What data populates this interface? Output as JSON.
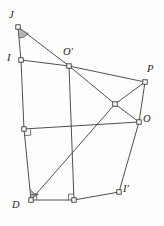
{
  "figure": {
    "type": "geometry-diagram",
    "width": 164,
    "height": 226,
    "background_color": "#fdfdfc",
    "stroke_color": "#3c3c3c",
    "vertex_fill_color": "#ffffff",
    "label_color": "#1d1d1d",
    "points": [
      {
        "id": "J",
        "label": "J",
        "x": 18,
        "y": 27,
        "label_x": 9,
        "label_y": 10,
        "marked": true
      },
      {
        "id": "I",
        "label": "I",
        "x": 21,
        "y": 60,
        "label_x": 7,
        "label_y": 53,
        "marked": true
      },
      {
        "id": "Op",
        "label": "O'",
        "x": 69,
        "y": 66,
        "label_x": 63,
        "label_y": 47,
        "marked": true
      },
      {
        "id": "P",
        "label": "P",
        "x": 145,
        "y": 82,
        "label_x": 147,
        "label_y": 64,
        "marked": true
      },
      {
        "id": "O",
        "label": "O",
        "x": 139,
        "y": 122,
        "label_x": 143,
        "label_y": 114,
        "marked": true
      },
      {
        "id": "Ip",
        "label": "I'",
        "x": 119,
        "y": 192,
        "label_x": 123,
        "label_y": 184,
        "marked": true
      },
      {
        "id": "D",
        "label": "D",
        "x": 31,
        "y": 200,
        "label_x": 12,
        "label_y": 200,
        "marked": true
      },
      {
        "id": "A",
        "label": "",
        "x": 24,
        "y": 129,
        "label_x": 0,
        "label_y": 0,
        "marked": true
      },
      {
        "id": "B",
        "label": "",
        "x": 74,
        "y": 200,
        "label_x": 0,
        "label_y": 0,
        "marked": true
      },
      {
        "id": "X",
        "label": "",
        "x": 115,
        "y": 104,
        "label_x": 0,
        "label_y": 0,
        "marked": true
      }
    ],
    "segments": [
      {
        "from": "J",
        "to": "I",
        "name": "segment-J-I"
      },
      {
        "from": "J",
        "to": "Op",
        "name": "segment-J-Oprime"
      },
      {
        "from": "I",
        "to": "Op",
        "name": "segment-I-Oprime"
      },
      {
        "from": "I",
        "to": "A",
        "name": "segment-I-A"
      },
      {
        "from": "A",
        "to": "D",
        "name": "segment-A-D"
      },
      {
        "from": "A",
        "to": "O",
        "name": "segment-A-O"
      },
      {
        "from": "Op",
        "to": "P",
        "name": "segment-Oprime-P"
      },
      {
        "from": "Op",
        "to": "X",
        "name": "segment-Oprime-X"
      },
      {
        "from": "X",
        "to": "O",
        "name": "segment-X-O"
      },
      {
        "from": "Op",
        "to": "B",
        "name": "segment-Oprime-B"
      },
      {
        "from": "P",
        "to": "X",
        "name": "segment-P-X"
      },
      {
        "from": "X",
        "to": "D",
        "name": "segment-X-D"
      },
      {
        "from": "P",
        "to": "O",
        "name": "segment-P-O"
      },
      {
        "from": "O",
        "to": "Ip",
        "name": "segment-O-Iprime"
      },
      {
        "from": "D",
        "to": "B",
        "name": "segment-D-B"
      },
      {
        "from": "B",
        "to": "Ip",
        "name": "segment-B-Iprime"
      }
    ],
    "angle_arcs": [
      {
        "at": "J",
        "name": "angle-arc-at-J"
      },
      {
        "at": "D",
        "name": "angle-arc-at-D"
      }
    ],
    "right_angles": [
      {
        "at": "A",
        "name": "right-angle-marker-at-A"
      },
      {
        "at": "B",
        "name": "right-angle-marker-at-B"
      },
      {
        "at": "D",
        "name": "right-angle-marker-at-D"
      },
      {
        "at": "X",
        "name": "right-angle-marker-at-X"
      }
    ]
  }
}
